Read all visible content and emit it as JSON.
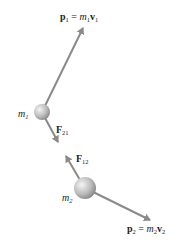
{
  "diagram": {
    "colors": {
      "arrow": "#8a8a8a",
      "text": "#222222",
      "ball_light": "#f2f2f2",
      "ball_dark": "#8c8c8c"
    },
    "particles": [
      {
        "id": "m1",
        "label_main": "m",
        "label_sub": "1",
        "cx": 42,
        "cy": 112,
        "r": 8
      },
      {
        "id": "m2",
        "label_main": "m",
        "label_sub": "2",
        "cx": 85,
        "cy": 188,
        "r": 11
      }
    ],
    "vectors": [
      {
        "id": "p1",
        "from": [
          42,
          112
        ],
        "to": [
          83,
          28
        ],
        "label": {
          "vec": "p",
          "vec_sub": "1",
          "eq": " = ",
          "mass": "m",
          "mass_sub": "1",
          "vel": "v",
          "vel_sub": "1"
        }
      },
      {
        "id": "F21",
        "from": [
          42,
          112
        ],
        "to": [
          58,
          142
        ],
        "label": {
          "vec": "F",
          "vec_sub": "21"
        }
      },
      {
        "id": "F12",
        "from": [
          85,
          188
        ],
        "to": [
          66,
          156
        ],
        "label": {
          "vec": "F",
          "vec_sub": "12"
        }
      },
      {
        "id": "p2",
        "from": [
          85,
          188
        ],
        "to": [
          150,
          220
        ],
        "label": {
          "vec": "p",
          "vec_sub": "2",
          "eq": " = ",
          "mass": "m",
          "mass_sub": "2",
          "vel": "v",
          "vel_sub": "2"
        }
      }
    ]
  }
}
